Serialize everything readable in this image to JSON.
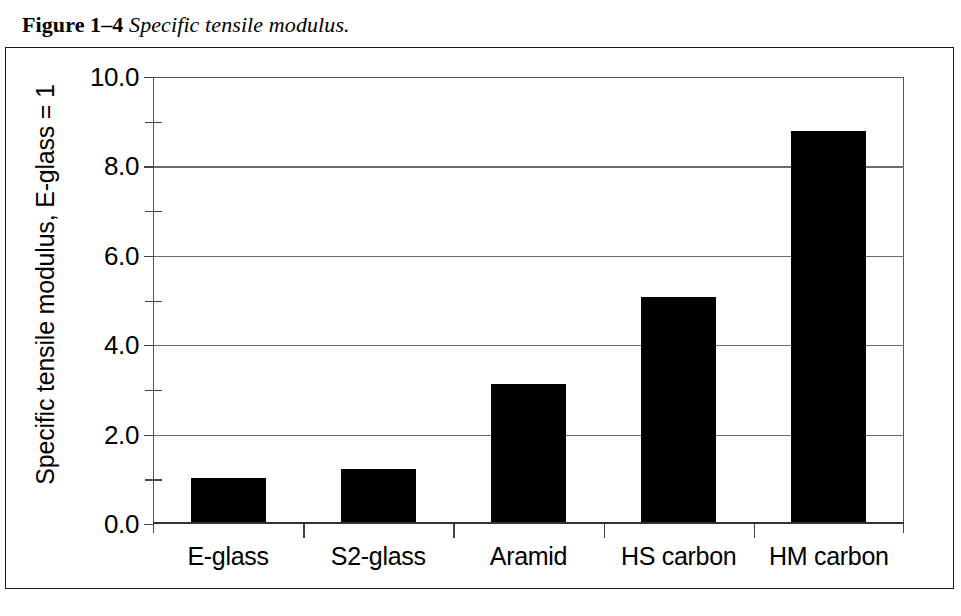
{
  "caption": {
    "figure_number": "Figure 1–4",
    "title": "Specific tensile modulus."
  },
  "chart_data": {
    "type": "bar",
    "title": "Specific tensile modulus.",
    "xlabel": "",
    "ylabel": "Specific tensile modulus, E-glass = 1",
    "categories": [
      "E-glass",
      "S2-glass",
      "Aramid",
      "HS carbon",
      "HM carbon"
    ],
    "values": [
      1.0,
      1.2,
      3.1,
      5.05,
      8.75
    ],
    "ylim": [
      0.0,
      10.0
    ],
    "ytick_major": [
      "0.0",
      "2.0",
      "4.0",
      "6.0",
      "8.0",
      "10.0"
    ],
    "ytick_major_values": [
      0.0,
      2.0,
      4.0,
      6.0,
      8.0,
      10.0
    ],
    "ytick_minor_values": [
      1.0,
      3.0,
      5.0,
      7.0,
      9.0
    ],
    "grid": "horizontal-major",
    "legend": "none",
    "bar_color": "#000000",
    "axis_color": "#333333",
    "grid_color": "#6b6b6b",
    "background": "#ffffff"
  }
}
